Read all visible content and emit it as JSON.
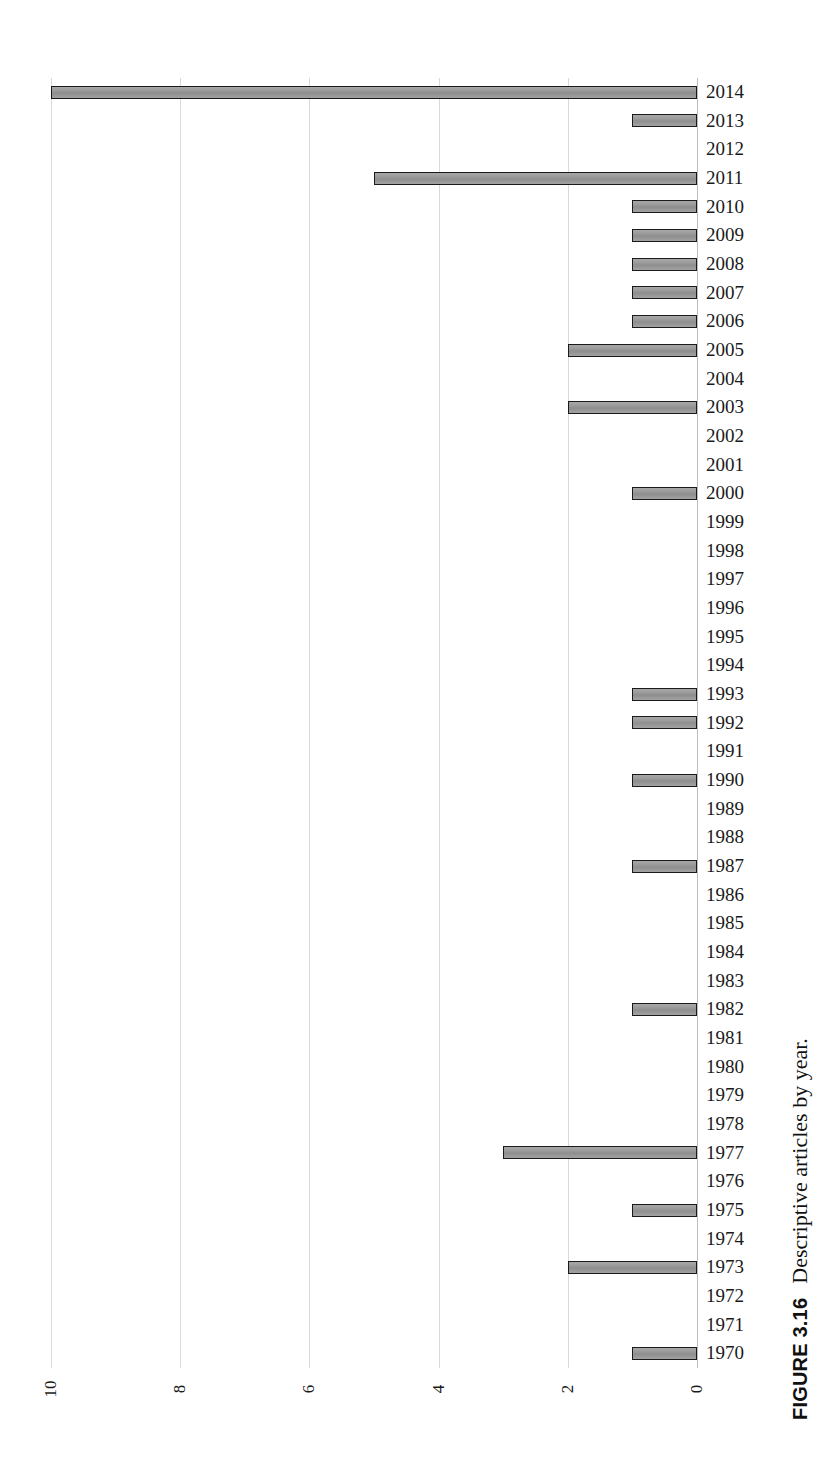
{
  "figure": {
    "number_label": "FIGURE 3.16",
    "caption_text": "Descriptive articles by year."
  },
  "chart_data": {
    "type": "bar",
    "orientation": "horizontal",
    "title": "Descriptive articles by year.",
    "xlabel": "",
    "ylabel": "",
    "xlim": [
      0,
      10
    ],
    "grid": true,
    "legend": "none",
    "bar_color": "#969696",
    "bar_edge_color": "#1a1a1a",
    "gridline_color": "#d9d9d9",
    "tick_labels": [
      "10",
      "8",
      "6",
      "4",
      "2",
      "0"
    ],
    "tick_values": [
      10,
      8,
      6,
      4,
      2,
      0
    ],
    "categories": [
      "2014",
      "2013",
      "2012",
      "2011",
      "2010",
      "2009",
      "2008",
      "2007",
      "2006",
      "2005",
      "2004",
      "2003",
      "2002",
      "2001",
      "2000",
      "1999",
      "1998",
      "1997",
      "1996",
      "1995",
      "1994",
      "1993",
      "1992",
      "1991",
      "1990",
      "1989",
      "1988",
      "1987",
      "1986",
      "1985",
      "1984",
      "1983",
      "1982",
      "1981",
      "1980",
      "1979",
      "1978",
      "1977",
      "1976",
      "1975",
      "1974",
      "1973",
      "1972",
      "1971",
      "1970"
    ],
    "values": [
      10,
      1,
      0,
      5,
      1,
      1,
      1,
      1,
      1,
      2,
      0,
      2,
      0,
      0,
      1,
      0,
      0,
      0,
      0,
      0,
      0,
      1,
      1,
      0,
      1,
      0,
      0,
      1,
      0,
      0,
      0,
      0,
      1,
      0,
      0,
      0,
      0,
      3,
      0,
      1,
      0,
      2,
      0,
      0,
      1
    ]
  }
}
